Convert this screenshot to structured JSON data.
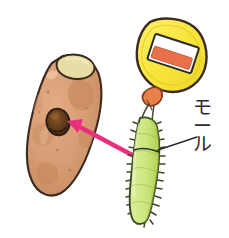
{
  "illustration": {
    "title": "Sweet potato and bottle-brush (pipe cleaner) cleaning illustration",
    "style": "hand-drawn colored-pencil sketch on white background",
    "background_color": "#ffffff",
    "canvas": {
      "width": 229,
      "height": 238
    }
  },
  "objects": {
    "sweet_potato": {
      "name": "sweet-potato",
      "description": "oval tapered sweet potato tilted, with a dark round hole and a pale cut end at the top",
      "body_color": "#d9a077",
      "body_shadow_color": "#c08a60",
      "mottle_color": "#c2885f",
      "outline_color": "#3a2a20",
      "highlight_color": "#e7bd9b",
      "cut_end_color": "#e6dca6",
      "cut_end_outline": "#3a2a20",
      "hole": {
        "name": "potato-hole",
        "fill_color": "#5c3a1e",
        "inner_color": "#7a4a24",
        "rim_color": "#2b1a10"
      }
    },
    "bottle": {
      "name": "detergent-bottle",
      "description": "rounded square yellow bottle with orange nozzle and a white label with an orange band",
      "body_color": "#f8e53c",
      "outline_color": "#3a2a20",
      "nozzle_color": "#e8804a",
      "nozzle_outline": "#8a3d1c",
      "label": {
        "name": "bottle-label",
        "background_color": "#ffffff",
        "band_color": "#e8714a",
        "outline_color": "#2b2b2b"
      }
    },
    "pipe_cleaner": {
      "name": "pipe-cleaner-brush",
      "description": "light green fuzzy chenille stem / pipe cleaner bent and inserted into the bottle nozzle",
      "body_color": "#cfe87f",
      "shade_color": "#b9d95f",
      "outline_color": "#3d4a22",
      "bristle_color": "#3d4a22",
      "wire_color": "#5a5a4a"
    },
    "arrow": {
      "name": "action-arrow",
      "description": "bright pink arrow pointing from the pipe cleaner to the hole in the sweet potato",
      "color": "#ea2f7e",
      "from": {
        "x": 133,
        "y": 155
      },
      "to": {
        "x": 68,
        "y": 122
      }
    },
    "leader_line": {
      "name": "label-leader-line",
      "description": "thin black line connecting the モール label to the pipe cleaner",
      "color": "#2b2b2b",
      "from": {
        "x": 196,
        "y": 138
      },
      "to": {
        "x": 158,
        "y": 148
      }
    }
  },
  "labels": {
    "pipe_cleaner_label": {
      "name": "pipe-cleaner-label",
      "text_vertical": [
        "モ",
        "ー",
        "ル"
      ],
      "text": "モール",
      "romaji": "mōru",
      "meaning": "pipe cleaner",
      "color": "#2b2b2b",
      "position": {
        "x": 196,
        "y": 100
      }
    }
  }
}
